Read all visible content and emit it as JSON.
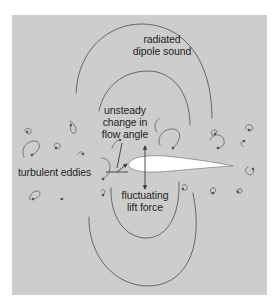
{
  "figure": {
    "background_color": "#ffffff",
    "panel_color": "#cdcdcd",
    "line_color": "#5a5a5a",
    "airfoil_fill": "#ffffff"
  },
  "labels": {
    "sound": {
      "line1": "radiated",
      "line2": "dipole sound"
    },
    "flow_angle": {
      "line1": "unsteady",
      "line2": "change in",
      "line3": "flow angle"
    },
    "eddies": {
      "line1": "turbulent eddies"
    },
    "lift": {
      "line1": "fluctuating",
      "line2": "lift force"
    }
  },
  "elements": {
    "wavefronts_upper": [
      "outer-wavefront-upper",
      "inner-wavefront-upper"
    ],
    "wavefronts_lower": [
      "outer-wavefront-lower",
      "inner-wavefront-lower"
    ],
    "airfoil": "airfoil",
    "lift_arrow": "double-headed-vertical-arrow",
    "eddy_count": 20
  }
}
